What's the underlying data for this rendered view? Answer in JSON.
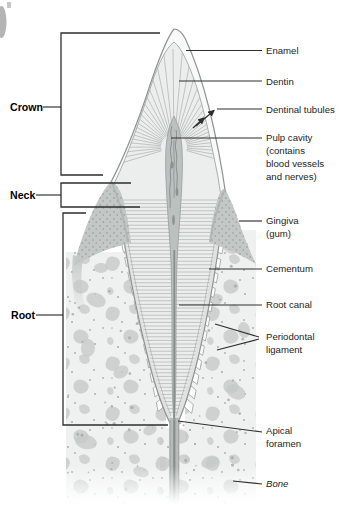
{
  "figure": {
    "region_labels": {
      "crown": "Crown",
      "neck": "Neck",
      "root": "Root"
    },
    "part_labels": {
      "enamel": "Enamel",
      "dentin": "Dentin",
      "dentinal_tubules": "Dentinal tubules",
      "pulp_cavity": [
        "Pulp cavity",
        "(contains",
        "blood vessels",
        "and nerves)"
      ],
      "gingiva": [
        "Gingiva",
        "(gum)"
      ],
      "cementum": "Cementum",
      "root_canal": "Root canal",
      "periodontal_ligament": [
        "Periodontal",
        "ligament"
      ],
      "apical_foramen": [
        "Apical",
        "foramen"
      ],
      "bone": "Bone"
    },
    "colors": {
      "leader_line": "#2e2e2e",
      "label_text": "#1d1d1d",
      "enamel": "#f8f9f8",
      "dentin": "#eceeed",
      "dentin_hatch": "#b3b7b5",
      "pulp": "#bcc1c0",
      "gingiva": "#c3c7c6",
      "bone_background": "#eff1f0",
      "bone_blob": "#c8ccca",
      "periodontal_block": "#fcfdfc"
    }
  }
}
